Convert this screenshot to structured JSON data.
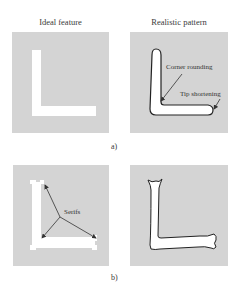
{
  "figure": {
    "part_a": {
      "caption": "a)",
      "left_title": "Ideal feature",
      "right_title": "Realistic pattern",
      "annotations": {
        "corner_rounding": "Corner rounding",
        "tip_shortening": "Tip shortening"
      }
    },
    "part_b": {
      "caption": "b)",
      "annotations": {
        "serifs": "Serifs"
      }
    },
    "colors": {
      "panel_background": "#d4d4d4",
      "feature_fill": "#ffffff",
      "outline": "#222222",
      "arrow": "#333333"
    }
  }
}
